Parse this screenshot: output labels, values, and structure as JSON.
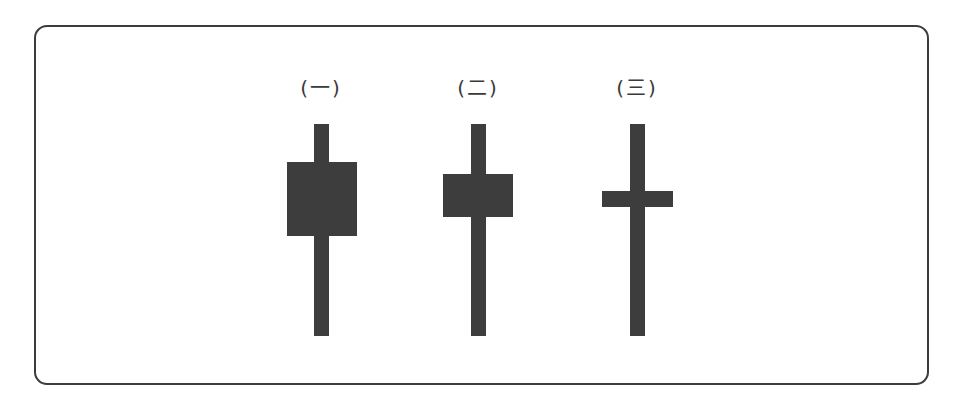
{
  "diagram": {
    "type": "candlestick-shapes",
    "colors": {
      "frame": "#3c3c3c",
      "candle": "#3d3d3d",
      "text": "#3a3a3a",
      "background": "#ffffff"
    },
    "candles": [
      {
        "label": "(一)",
        "center_x": 321,
        "wick": {
          "x": 314,
          "y": 124,
          "w": 15,
          "h": 212
        },
        "body": {
          "x": 287,
          "y": 162,
          "w": 70,
          "h": 74
        },
        "description": "tall body, upper and lower shadows"
      },
      {
        "label": "(二)",
        "center_x": 478,
        "wick": {
          "x": 471,
          "y": 124,
          "w": 15,
          "h": 212
        },
        "body": {
          "x": 443,
          "y": 174,
          "w": 70,
          "h": 43
        },
        "description": "medium body, upper and lower shadows"
      },
      {
        "label": "(三)",
        "center_x": 637,
        "wick": {
          "x": 630,
          "y": 124,
          "w": 15,
          "h": 212
        },
        "body": {
          "x": 602,
          "y": 191,
          "w": 71,
          "h": 16
        },
        "description": "cross / doji-like thin body"
      }
    ]
  }
}
